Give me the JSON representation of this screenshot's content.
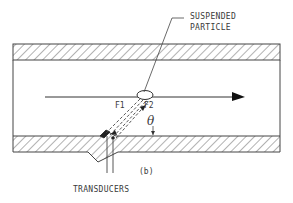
{
  "diagram": {
    "type": "ultrasonic flow measurement cross-section",
    "labels": {
      "particle_line1": "SUSPENDED",
      "particle_line2": "PARTICLE",
      "f1": "F1",
      "f2": "F2",
      "theta": "θ",
      "panel": "(b)",
      "transducers": "TRANSDUCERS"
    },
    "elements": {
      "pipe_walls": [
        "upper-wall",
        "lower-wall"
      ],
      "flow_arrow": "left-to-right",
      "transducer_count": 2,
      "beams": [
        "F1 transmitted beam",
        "F2 reflected beam"
      ]
    },
    "colors": {
      "ink": "#3a3a3a",
      "background": "#ffffff"
    }
  }
}
